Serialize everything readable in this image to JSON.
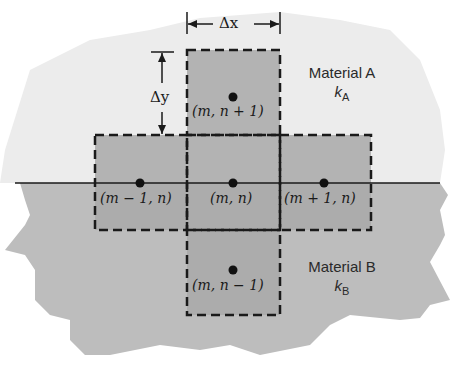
{
  "diagram": {
    "dimensions": {
      "dx_label": "Δx",
      "dy_label": "Δy"
    },
    "materials": [
      {
        "name": "Material A",
        "k_symbol": "k",
        "k_subscript": "A",
        "region": "upper",
        "color": "#ececec"
      },
      {
        "name": "Material B",
        "k_symbol": "k",
        "k_subscript": "B",
        "region": "lower",
        "color": "#bdbdbd"
      }
    ],
    "nodes": [
      {
        "id": "top",
        "label": "(m, n + 1)"
      },
      {
        "id": "left",
        "label": "(m − 1, n)"
      },
      {
        "id": "center",
        "label": "(m, n)"
      },
      {
        "id": "right",
        "label": "(m + 1, n)"
      },
      {
        "id": "bottom",
        "label": "(m, n − 1)"
      }
    ],
    "colors": {
      "control_volume_fill": "#a9a9a9",
      "line": "#1a1a1a",
      "material_a": "#ececec",
      "material_b": "#bdbdbd"
    }
  }
}
